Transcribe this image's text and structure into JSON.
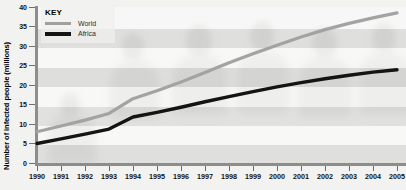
{
  "chart_data": {
    "type": "line",
    "title": "",
    "xlabel": "",
    "ylabel": "Number of infected people (millions)",
    "xlim": [
      1990,
      2005
    ],
    "ylim": [
      0,
      40
    ],
    "ytick_step": 5,
    "grid": "horizontal-bands",
    "legend_position": "top-left",
    "legend_title": "KEY",
    "x": [
      1990,
      1991,
      1992,
      1993,
      1994,
      1995,
      1996,
      1997,
      1998,
      1999,
      2000,
      2001,
      2002,
      2003,
      2004,
      2005
    ],
    "categories": [
      "1990",
      "1991",
      "1992",
      "1993",
      "1994",
      "1995",
      "1996",
      "1997",
      "1998",
      "1999",
      "2000",
      "2001",
      "2002",
      "2003",
      "2004",
      "2005"
    ],
    "series": [
      {
        "name": "World",
        "color": "#a3a3a3",
        "values": [
          8.0,
          9.5,
          11.0,
          12.7,
          16.5,
          18.5,
          20.8,
          23.2,
          25.7,
          28.0,
          30.2,
          32.3,
          34.2,
          35.8,
          37.2,
          38.5
        ]
      },
      {
        "name": "Africa",
        "color": "#141414",
        "values": [
          5.0,
          6.2,
          7.4,
          8.7,
          11.8,
          13.0,
          14.3,
          15.7,
          17.0,
          18.3,
          19.5,
          20.6,
          21.6,
          22.5,
          23.3,
          23.9
        ]
      }
    ],
    "ytick_labels": [
      "0",
      "5",
      "10",
      "15",
      "20",
      "25",
      "30",
      "35",
      "40"
    ],
    "ytick_values": [
      0,
      5,
      10,
      15,
      20,
      25,
      30,
      35,
      40
    ]
  },
  "legend": {
    "title": "KEY",
    "items": [
      {
        "label": "World",
        "color": "#a3a3a3"
      },
      {
        "label": "Africa",
        "color": "#141414"
      }
    ]
  },
  "axes": {
    "y_title": "Number of infected people (millions)"
  }
}
